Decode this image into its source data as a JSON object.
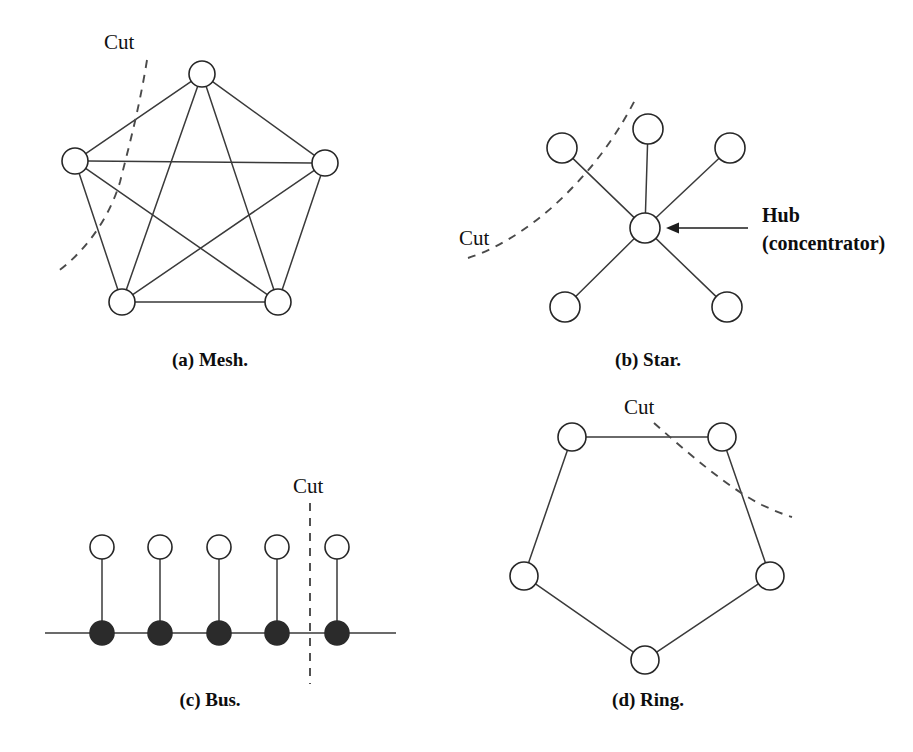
{
  "figure": {
    "background_color": "#ffffff",
    "line_color": "#3a3a3a",
    "node_fill": "#ffffff",
    "node_stroke": "#262626",
    "tap_fill": "#2b2b2b",
    "cut_color": "#4a4a4a",
    "text_color": "#111111"
  },
  "panels": {
    "mesh": {
      "caption": "(a) Mesh.",
      "caption_x": 210,
      "caption_y": 366,
      "cut_label": "Cut",
      "cut_label_x": 104,
      "cut_label_y": 49,
      "node_radius": 13,
      "nodes": [
        {
          "id": "m-top",
          "label": "",
          "x": 202,
          "y": 74
        },
        {
          "id": "m-right",
          "label": "",
          "x": 325,
          "y": 163
        },
        {
          "id": "m-bottom-right",
          "label": "",
          "x": 278,
          "y": 302
        },
        {
          "id": "m-bottom-left",
          "label": "",
          "x": 122,
          "y": 302
        },
        {
          "id": "m-left",
          "label": "",
          "x": 75,
          "y": 161
        }
      ],
      "edges": [
        [
          0,
          1
        ],
        [
          0,
          2
        ],
        [
          0,
          3
        ],
        [
          0,
          4
        ],
        [
          1,
          2
        ],
        [
          1,
          3
        ],
        [
          1,
          4
        ],
        [
          2,
          3
        ],
        [
          2,
          4
        ],
        [
          3,
          4
        ]
      ],
      "cut_path": "M 147 60 C 139 110 128 150 120 182 C 108 222 82 254 57 272"
    },
    "star": {
      "caption": "(b) Star.",
      "caption_x": 648,
      "caption_y": 366,
      "cut_label": "Cut",
      "cut_label_x": 459,
      "cut_label_y": 245,
      "node_radius": 15,
      "hub_radius": 15,
      "hub": {
        "id": "s-hub",
        "label": "",
        "x": 645,
        "y": 228
      },
      "nodes": [
        {
          "id": "s-top",
          "label": "",
          "x": 648,
          "y": 129
        },
        {
          "id": "s-upper-left",
          "label": "",
          "x": 562,
          "y": 148
        },
        {
          "id": "s-upper-right",
          "label": "",
          "x": 730,
          "y": 148
        },
        {
          "id": "s-lower-left",
          "label": "",
          "x": 565,
          "y": 307
        },
        {
          "id": "s-lower-right",
          "label": "",
          "x": 727,
          "y": 307
        }
      ],
      "cut_path": "M 468 258 C 500 248 540 222 572 188 C 602 157 622 126 637 96",
      "hub_annotation": {
        "line1": "Hub",
        "line2": "(concentrator)",
        "text_x": 762,
        "text_y1": 222,
        "text_y2": 250,
        "arrow_from_x": 748,
        "arrow_to_x": 666,
        "arrow_y": 228
      }
    },
    "bus": {
      "caption": "(c) Bus.",
      "caption_x": 210,
      "caption_y": 706,
      "cut_label": "Cut",
      "cut_label_x": 293,
      "cut_label_y": 493,
      "node_radius": 12,
      "tap_radius": 12,
      "station_y": 547,
      "backbone_y": 633,
      "backbone_x1": 45,
      "backbone_x2": 396,
      "stations": [
        {
          "id": "b-station-1",
          "label": "",
          "x": 102
        },
        {
          "id": "b-station-2",
          "label": "",
          "x": 160
        },
        {
          "id": "b-station-3",
          "label": "",
          "x": 219
        },
        {
          "id": "b-station-4",
          "label": "",
          "x": 277
        },
        {
          "id": "b-station-5",
          "label": "",
          "x": 337
        }
      ],
      "cut_path": "M 310 503 L 310 684"
    },
    "ring": {
      "caption": "(d) Ring.",
      "caption_x": 648,
      "caption_y": 706,
      "cut_label": "Cut",
      "cut_label_x": 624,
      "cut_label_y": 414,
      "node_radius": 14,
      "nodes": [
        {
          "id": "r-top-left",
          "label": "",
          "x": 572,
          "y": 437
        },
        {
          "id": "r-top-right",
          "label": "",
          "x": 722,
          "y": 437
        },
        {
          "id": "r-right",
          "label": "",
          "x": 770,
          "y": 576
        },
        {
          "id": "r-bottom",
          "label": "",
          "x": 645,
          "y": 660
        },
        {
          "id": "r-left",
          "label": "",
          "x": 524,
          "y": 576
        }
      ],
      "edges": [
        [
          0,
          1
        ],
        [
          1,
          2
        ],
        [
          2,
          3
        ],
        [
          3,
          4
        ],
        [
          4,
          0
        ]
      ],
      "cut_path": "M 654 423 C 690 455 730 489 762 505 C 775 511 785 515 792 517"
    }
  }
}
